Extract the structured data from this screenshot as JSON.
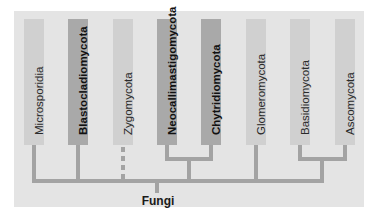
{
  "diagram": {
    "type": "phylogenetic-tree",
    "root": "Fungi",
    "taxa": [
      {
        "label": "Microsporidia",
        "emphasis": false
      },
      {
        "label": "Blastocladiomycota",
        "emphasis": true
      },
      {
        "label": "Zygomycota",
        "emphasis": false,
        "connection": "dashed"
      },
      {
        "label": "Neocallimastigomycota",
        "emphasis": true
      },
      {
        "label": "Chytridiomycota",
        "emphasis": true
      },
      {
        "label": "Glomeromycota",
        "emphasis": false
      },
      {
        "label": "Basidiomycota",
        "emphasis": false
      },
      {
        "label": "Ascomycota",
        "emphasis": false
      }
    ],
    "clades": [
      {
        "members": [
          "Neocallimastigomycota",
          "Chytridiomycota"
        ]
      },
      {
        "members": [
          "Basidiomycota",
          "Ascomycota"
        ]
      }
    ],
    "colors": {
      "panel": "#e4e4e4",
      "bar_light": "#d0d0d0",
      "bar_dark": "#a9a9a9",
      "branch": "#a3a3a3"
    }
  }
}
